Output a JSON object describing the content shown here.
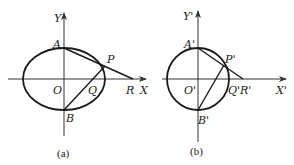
{
  "figures": [
    {
      "id": "a",
      "caption": "(a)",
      "shape": "ellipse",
      "axes": {
        "x_label": "X",
        "y_label": "Y"
      },
      "points": {
        "origin": "O",
        "top": "A",
        "bottom": "B",
        "curve_point": "P",
        "x_intersect_BP": "Q",
        "x_intersect_AP": "R"
      }
    },
    {
      "id": "b",
      "caption": "(b)",
      "shape": "circle",
      "axes": {
        "x_label": "X'",
        "y_label": "Y'"
      },
      "points": {
        "origin": "O'",
        "top": "A'",
        "bottom": "B'",
        "curve_point": "P'",
        "x_intersect_BP": "Q'",
        "x_intersect_AP": "R'"
      }
    }
  ],
  "colors": {
    "ink": "#1a1a1a",
    "axis": "#333333",
    "background": "#ffffff"
  }
}
